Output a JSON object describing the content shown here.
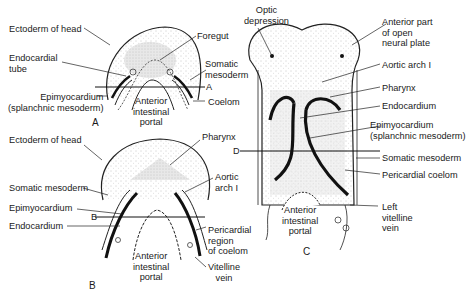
{
  "figure": {
    "panels": [
      {
        "id": "A",
        "label": "A",
        "labels": [
          {
            "key": "ectoderm_of_head",
            "text": "Ectoderm of head"
          },
          {
            "key": "endocardial_tube",
            "text": "Endocardial\ntube"
          },
          {
            "key": "epimyocardium",
            "text": "Epimyocardium\n(splanchnic mesoderm)"
          },
          {
            "key": "foregut",
            "text": "Foregut"
          },
          {
            "key": "somatic_mesoderm",
            "text": "Somatic\nmesoderm"
          },
          {
            "key": "section_line",
            "text": "A"
          },
          {
            "key": "coelom",
            "text": "Coelom"
          },
          {
            "key": "anterior_intestinal_portal",
            "text": "Anterior\nintestinal\nportal"
          }
        ]
      },
      {
        "id": "B",
        "label": "B",
        "labels": [
          {
            "key": "ectoderm_of_head",
            "text": "Ectoderm of head"
          },
          {
            "key": "pharynx",
            "text": "Pharynx"
          },
          {
            "key": "somatic_mesoderm",
            "text": "Somatic mesoderm"
          },
          {
            "key": "aortic_arch_1",
            "text": "Aortic\narch I"
          },
          {
            "key": "epimyocardium",
            "text": "Epimyocardium"
          },
          {
            "key": "section_line",
            "text": "B"
          },
          {
            "key": "endocardium",
            "text": "Endocardium"
          },
          {
            "key": "pericardial_region",
            "text": "Pericardial\nregion\nof coelom"
          },
          {
            "key": "anterior_intestinal_portal",
            "text": "Anterior\nintestinal\nportal"
          },
          {
            "key": "vitelline_vein",
            "text": "Vitelline\nvein"
          }
        ]
      },
      {
        "id": "C",
        "label": "C",
        "labels": [
          {
            "key": "optic_depression",
            "text": "Optic\ndepression"
          },
          {
            "key": "anterior_neural_plate",
            "text": "Anterior part\nof open\nneural plate"
          },
          {
            "key": "aortic_arch_1",
            "text": "Aortic arch I"
          },
          {
            "key": "pharynx",
            "text": "Pharynx"
          },
          {
            "key": "endocardium",
            "text": "Endocardium"
          },
          {
            "key": "epimyocardium",
            "text": "Epimyocardium\n(splanchnic mesoderm)"
          },
          {
            "key": "section_line",
            "text": "D"
          },
          {
            "key": "somatic_mesoderm",
            "text": "Somatic mesoderm"
          },
          {
            "key": "pericardial_coelom",
            "text": "Pericardial coelom"
          },
          {
            "key": "left_vitelline_vein",
            "text": "Left\nvitelline\nvein"
          },
          {
            "key": "anterior_intestinal_portal",
            "text": "Anterior\nintestinal\nportal"
          }
        ]
      }
    ]
  }
}
